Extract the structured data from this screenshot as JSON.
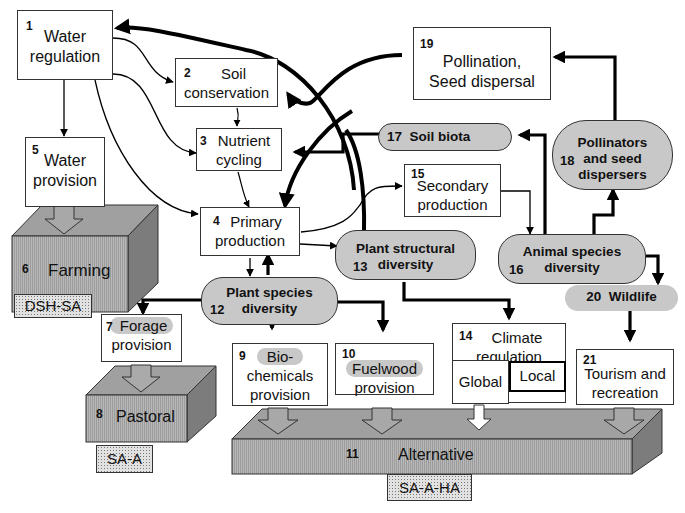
{
  "nodes": {
    "n1": {
      "num": "1",
      "line1": "Water",
      "line2": "regulation"
    },
    "n2": {
      "num": "2",
      "line1": "Soil",
      "line2": "conservation"
    },
    "n3": {
      "num": "3",
      "line1": "Nutrient",
      "line2": "cycling"
    },
    "n4": {
      "num": "4",
      "line1": "Primary",
      "line2": "production"
    },
    "n5": {
      "num": "5",
      "line1": "Water",
      "line2": "provision"
    },
    "n6": {
      "num": "6",
      "label": "Farming",
      "tag": "DSH-SA"
    },
    "n7": {
      "num": "7",
      "line1": "Forage",
      "line2": "provision"
    },
    "n8": {
      "num": "8",
      "label": "Pastoral",
      "tag": "SA-A"
    },
    "n9": {
      "num": "9",
      "line1": "Bio-",
      "line2": "chemicals",
      "line3": "provision"
    },
    "n10": {
      "num": "10",
      "line1": "Fuelwood",
      "line2": "provision"
    },
    "n11": {
      "num": "11",
      "label": "Alternative",
      "tag": "SA-A-HA"
    },
    "n12": {
      "num": "12",
      "line1": "Plant species",
      "line2": "diversity"
    },
    "n13": {
      "num": "13",
      "line1": "Plant structural",
      "line2": "diversity"
    },
    "n14": {
      "num": "14",
      "line1": "Climate",
      "line2": "regulation",
      "global": "Global",
      "local": "Local"
    },
    "n15": {
      "num": "15",
      "line1": "Secondary",
      "line2": "production"
    },
    "n16": {
      "num": "16",
      "line1": "Animal species",
      "line2": "diversity"
    },
    "n17": {
      "num": "17",
      "label": "Soil biota"
    },
    "n18": {
      "num": "18",
      "line1": "Pollinators",
      "line2": "and seed",
      "line3": "dispersers"
    },
    "n19": {
      "num": "19",
      "line1": "Pollination,",
      "line2": "Seed dispersal"
    },
    "n20": {
      "num": "20",
      "label": "Wildlife"
    },
    "n21": {
      "num": "21",
      "line1": "Tourism and",
      "line2": "recreation"
    }
  },
  "colors": {
    "pill_fill": "#c8c8c8",
    "slab_front": "#b0b0b0",
    "slab_top": "#9a9a9a",
    "slab_side": "#7a7a7a",
    "line": "#000000"
  }
}
